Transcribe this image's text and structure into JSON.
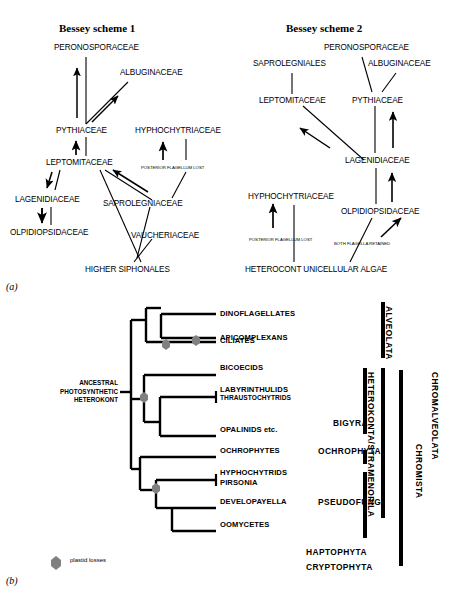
{
  "figure": {
    "panel_a_label": "(a)",
    "panel_b_label": "(b)",
    "ink": "#000000",
    "plastid_marker_color": "#808080"
  },
  "scheme1": {
    "title": "Bessey scheme 1",
    "nodes": [
      {
        "id": "peronosporaceae",
        "label": "PERONOSPORACEAE"
      },
      {
        "id": "albuginaceae",
        "label": "ALBUGINACEAE"
      },
      {
        "id": "pythiaceae",
        "label": "PYTHIACEAE"
      },
      {
        "id": "hyphochytriaceae",
        "label": "HYPHOCHYTRIACEAE"
      },
      {
        "id": "leptomitaceae",
        "label": "LEPTOMITACEAE"
      },
      {
        "id": "lagenidiaceae",
        "label": "LAGENIDIACEAE"
      },
      {
        "id": "saprolegniaceae",
        "label": "SAPROLEGNIACEAE"
      },
      {
        "id": "olpidiopsidaceae",
        "label": "OLPIDIOPSIDACEAE"
      },
      {
        "id": "vaucheriaceae",
        "label": "VAUCHERIACEAE"
      },
      {
        "id": "higher-siphonales",
        "label": "HIGHER SIPHONALES"
      }
    ],
    "annotations": [
      {
        "id": "posterior-flagellum-lost",
        "label": "POSTERIOR FLAGELLUM LOST"
      }
    ]
  },
  "scheme2": {
    "title": "Bessey scheme 2",
    "nodes": [
      {
        "id": "saprolegniales",
        "label": "SAPROLEGNIALES"
      },
      {
        "id": "peronosporaceae",
        "label": "PERONOSPORACEAE"
      },
      {
        "id": "albuginaceae",
        "label": "ALBUGINACEAE"
      },
      {
        "id": "leptomitaceae",
        "label": "LEPTOMITACEAE"
      },
      {
        "id": "pythiaceae",
        "label": "PYTHIACEAE"
      },
      {
        "id": "lagenidiaceae",
        "label": "LAGENIDIACEAE"
      },
      {
        "id": "hyphochytriaceae",
        "label": "HYPHOCHYTRIACEAE"
      },
      {
        "id": "olpidiopsidaceae",
        "label": "OLPIDIOPSIDACEAE"
      },
      {
        "id": "heterocont-unicellular-algae",
        "label": "HETEROCONT UNICELLULAR ALGAE"
      }
    ],
    "annotations": [
      {
        "id": "posterior-flagellum-lost",
        "label": "POSTERIOR FLAGELLUM LOST"
      },
      {
        "id": "both-flagella-retained",
        "label": "BOTH FLAGELLA RETAINED"
      }
    ]
  },
  "cladogram": {
    "root_label_lines": [
      "ANCESTRAL",
      "PHOTOSYNTHETIC",
      "HETEROKONT"
    ],
    "root_label": "ANCESTRAL PHOTOSYNTHETIC HETEROKONT",
    "tips": [
      {
        "id": "dinoflagellates",
        "label": "DINOFLAGELLATES"
      },
      {
        "id": "apicomplexans",
        "label": "APICOMPLEXANS"
      },
      {
        "id": "ciliates",
        "label": "CILIATES"
      },
      {
        "id": "bicoecids",
        "label": "BICOECIDS"
      },
      {
        "id": "labyrinthulids",
        "label": "LABYRINTHULIDS"
      },
      {
        "id": "thraustochytrids",
        "label": "THRAUSTOCHYTRIDS"
      },
      {
        "id": "opalinids",
        "label": "OPALINIDS etc."
      },
      {
        "id": "ochrophytes",
        "label": "OCHROPHYTES"
      },
      {
        "id": "hyphochytrids",
        "label": "HYPHOCHYTRIDS"
      },
      {
        "id": "pirsonia",
        "label": "PIRSONIA"
      },
      {
        "id": "developayella",
        "label": "DEVELOPAYELLA"
      },
      {
        "id": "oomycetes",
        "label": "OOMYCETES"
      }
    ],
    "groups": [
      {
        "id": "alveolata",
        "label": "ALVEOLATA"
      },
      {
        "id": "bigyra",
        "label": "BIGYRA"
      },
      {
        "id": "ochrophyta",
        "label": "OCHROPHYTA"
      },
      {
        "id": "pseudofungi",
        "label": "PSEUDOFUNGI"
      },
      {
        "id": "heterokonta-stramenopila",
        "label": "HETEROKONTA/STRAMENOPILA"
      },
      {
        "id": "chromalveolata",
        "label": "CHROMALVEOLATA"
      },
      {
        "id": "chromista",
        "label": "CHROMISTA"
      }
    ],
    "extra_taxa": [
      {
        "id": "haptophyta",
        "label": "HAPTOPHYTA"
      },
      {
        "id": "cryptophyta",
        "label": "CRYPTOPHYTA"
      }
    ],
    "legend": {
      "marker_label": "plastid losses"
    }
  }
}
